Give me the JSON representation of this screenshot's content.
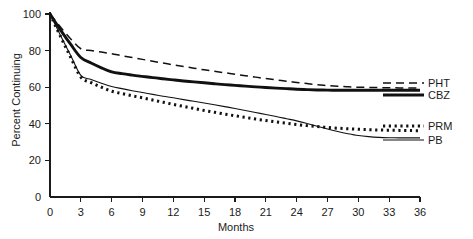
{
  "chart_data": {
    "type": "line",
    "title": "",
    "subtitle": "",
    "xlabel": "Months",
    "ylabel": "Percent Continuing",
    "xlim": [
      0,
      36
    ],
    "ylim": [
      0,
      100
    ],
    "xticks": [
      0,
      3,
      6,
      9,
      12,
      15,
      18,
      21,
      24,
      27,
      30,
      33,
      36
    ],
    "xtick_labels": [
      "0",
      "3",
      "6",
      "9",
      "12",
      "15",
      "18",
      "21",
      "24",
      "27",
      "30",
      "33",
      "36"
    ],
    "yticks": [
      0,
      20,
      40,
      60,
      80,
      100
    ],
    "ytick_labels": [
      "0",
      "20",
      "40",
      "60",
      "80",
      "100"
    ],
    "grid": false,
    "legend_position": "right-inline",
    "x": [
      0,
      1,
      2,
      3,
      4,
      5,
      6,
      7,
      8,
      9,
      10,
      11,
      12,
      13,
      14,
      15,
      16,
      17,
      18,
      19,
      20,
      21,
      22,
      23,
      24,
      25,
      26,
      27,
      28,
      29,
      30,
      31,
      32,
      33,
      34,
      35,
      36
    ],
    "series": [
      {
        "name": "PHT",
        "label": "PHT",
        "style": "dashed",
        "color": "#111111",
        "values": [
          100,
          93,
          86.5,
          81,
          80,
          79.2,
          78.3,
          77.2,
          76.2,
          75.2,
          74.2,
          73.2,
          72.2,
          71.3,
          70.4,
          69.5,
          68.7,
          67.9,
          67.1,
          66.3,
          65.5,
          64.7,
          64.0,
          63.3,
          62.6,
          62.0,
          61.4,
          60.9,
          60.5,
          60.2,
          60.0,
          59.9,
          59.8,
          59.7,
          59.6,
          59.6,
          59.5
        ]
      },
      {
        "name": "CBZ",
        "label": "CBZ",
        "style": "solid-thick",
        "color": "#111111",
        "values": [
          100,
          91.5,
          83.5,
          76.2,
          73.2,
          70.6,
          68.4,
          67.4,
          66.6,
          65.9,
          65.2,
          64.6,
          64.0,
          63.4,
          62.9,
          62.4,
          61.9,
          61.4,
          61.0,
          60.6,
          60.2,
          59.8,
          59.5,
          59.2,
          58.9,
          58.7,
          58.5,
          58.4,
          58.3,
          58.3,
          58.3,
          58.3,
          58.3,
          58.3,
          58.3,
          58.3,
          58.3
        ]
      },
      {
        "name": "PRM",
        "label": "PRM",
        "style": "dotted",
        "color": "#111111",
        "values": [
          100,
          88,
          76.5,
          65.5,
          62.5,
          60.0,
          57.8,
          56.5,
          55.3,
          54.2,
          53.0,
          51.8,
          50.6,
          49.5,
          48.4,
          47.3,
          46.3,
          45.3,
          44.4,
          43.5,
          42.6,
          41.8,
          41.0,
          40.3,
          39.6,
          39.0,
          38.5,
          38.0,
          37.6,
          37.3,
          37.0,
          36.8,
          36.6,
          36.5,
          36.4,
          36.3,
          36.2
        ]
      },
      {
        "name": "PB",
        "label": "PB",
        "style": "solid-thin",
        "color": "#111111",
        "values": [
          100,
          88.5,
          77.5,
          66.5,
          64.2,
          62.2,
          60.4,
          59.2,
          58.1,
          57.1,
          56.1,
          55.1,
          54.2,
          53.2,
          52.3,
          51.4,
          50.4,
          49.4,
          48.4,
          47.3,
          46.2,
          45.1,
          44.0,
          42.8,
          41.6,
          40.2,
          38.7,
          37.2,
          35.8,
          34.6,
          33.6,
          33.0,
          32.6,
          32.4,
          32.3,
          32.3,
          32.3
        ]
      }
    ]
  },
  "axes": {
    "ylabel": "Percent Continuing",
    "xlabel": "Months"
  },
  "legend": {
    "entries": [
      {
        "label": "PHT"
      },
      {
        "label": "CBZ"
      },
      {
        "label": "PRM"
      },
      {
        "label": "PB"
      }
    ]
  }
}
